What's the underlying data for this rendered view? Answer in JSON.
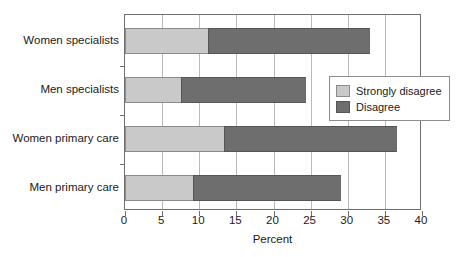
{
  "chart_data": {
    "type": "bar",
    "orientation": "horizontal",
    "stacked": true,
    "title": "",
    "xlabel": "Percent",
    "ylabel": "",
    "xlim": [
      0,
      40
    ],
    "ylim": null,
    "grid": true,
    "grid_axis": "x",
    "legend_position": "center-right",
    "categories": [
      "Women specialists",
      "Men specialists",
      "Women primary care",
      "Men primary care"
    ],
    "xticks": [
      0,
      5,
      10,
      15,
      20,
      25,
      30,
      35,
      40
    ],
    "xticklabels": [
      "0",
      "5",
      "10",
      "15",
      "20",
      "25",
      "30",
      "35",
      "40"
    ],
    "series": [
      {
        "name": "Strongly disagree",
        "color": "#c9c9c9",
        "values": [
          11.2,
          7.5,
          13.3,
          9.2
        ]
      },
      {
        "name": "Disagree",
        "color": "#6e6e6e",
        "values": [
          21.8,
          16.9,
          23.3,
          19.9
        ]
      }
    ],
    "totals": [
      33.0,
      24.4,
      36.6,
      29.1
    ]
  },
  "legend": {
    "items": [
      {
        "label": "Strongly disagree",
        "color": "#c9c9c9"
      },
      {
        "label": "Disagree",
        "color": "#6e6e6e"
      }
    ]
  },
  "axis": {
    "x_title": "Percent"
  },
  "colors": {
    "strongly_disagree": "#c9c9c9",
    "disagree": "#6e6e6e",
    "frame": "#6f6f6f",
    "gridline": "#b9b9b9",
    "text": "#1a1a1a"
  }
}
